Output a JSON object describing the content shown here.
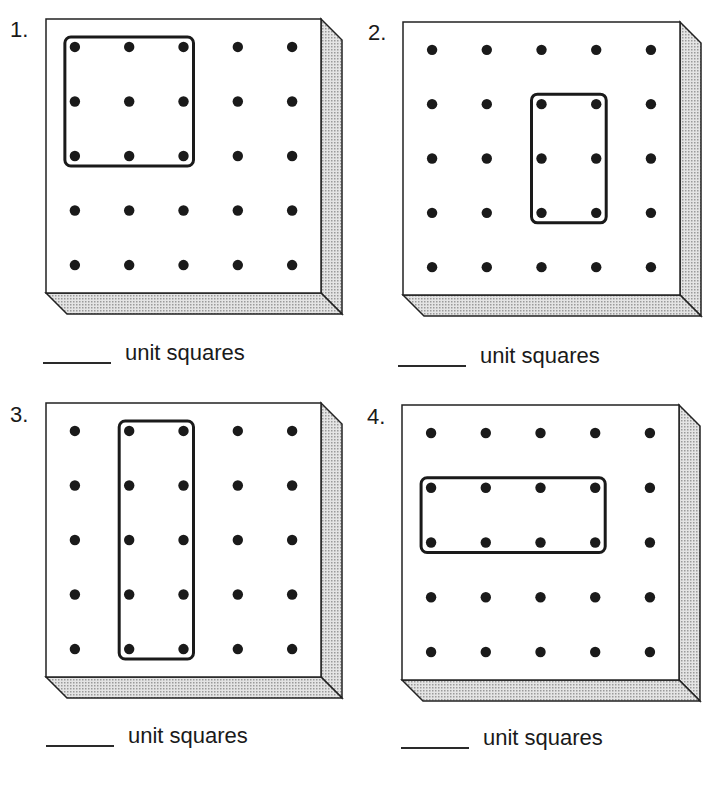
{
  "worksheet": {
    "grid": {
      "cols": 5,
      "rows": 5,
      "peg_color": "#1a1a1a",
      "shade_color": "#9a9a9a"
    },
    "problems": [
      {
        "number": "1.",
        "number_pos": [
          10,
          19
        ],
        "board": {
          "x": 46,
          "y": 19,
          "w": 275,
          "h": 274
        },
        "band": {
          "col_start": 0,
          "col_end": 2,
          "row_start": 0,
          "row_end": 2
        },
        "answer": {
          "blank": "",
          "label": "unit squares",
          "x": 43,
          "y": 340,
          "blank_width": 68
        }
      },
      {
        "number": "2.",
        "number_pos": [
          368,
          22
        ],
        "board": {
          "x": 403,
          "y": 22,
          "w": 277,
          "h": 273
        },
        "band": {
          "col_start": 2,
          "col_end": 3,
          "row_start": 1,
          "row_end": 3
        },
        "answer": {
          "blank": "",
          "label": "unit squares",
          "x": 398,
          "y": 343,
          "blank_width": 68
        }
      },
      {
        "number": "3.",
        "number_pos": [
          10,
          404
        ],
        "board": {
          "x": 46,
          "y": 403,
          "w": 275,
          "h": 274
        },
        "band": {
          "col_start": 1,
          "col_end": 2,
          "row_start": 0,
          "row_end": 4
        },
        "answer": {
          "blank": "",
          "label": "unit squares",
          "x": 46,
          "y": 723,
          "blank_width": 68
        }
      },
      {
        "number": "4.",
        "number_pos": [
          367,
          406
        ],
        "board": {
          "x": 402,
          "y": 405,
          "w": 277,
          "h": 275
        },
        "band": {
          "col_start": 0,
          "col_end": 3,
          "row_start": 1,
          "row_end": 2
        },
        "answer": {
          "blank": "",
          "label": "unit squares",
          "x": 401,
          "y": 725,
          "blank_width": 68
        }
      }
    ]
  }
}
